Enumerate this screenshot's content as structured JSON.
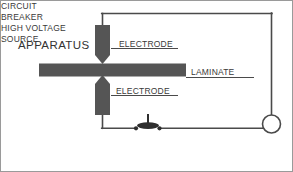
{
  "figure": {
    "background_color": "#ffffff",
    "border_color": "#9a9a9a",
    "line_color": "#4a4a4a",
    "part_color": "#555555",
    "text_color": "#3a3a3a"
  },
  "labels": {
    "apparatus": "APPARATUS",
    "electrode_top": "ELECTRODE",
    "electrode_bottom": "ELECTRODE",
    "laminate": "LAMINATE",
    "circuit_breaker_line1": "CIRCUIT",
    "circuit_breaker_line2": "BREAKER",
    "hv_source_line1": "HIGH VOLTAGE",
    "hv_source_line2": "SOURCE"
  },
  "diagram": {
    "type": "schematic",
    "components": [
      {
        "name": "electrode-top",
        "shape": "tapered-bar-pointing-down",
        "fill": "#555555",
        "x": 94,
        "y": 24,
        "width": 15,
        "height": 39
      },
      {
        "name": "electrode-bottom",
        "shape": "tapered-bar-pointing-up",
        "fill": "#555555",
        "x": 94,
        "y": 79,
        "width": 15,
        "height": 39
      },
      {
        "name": "laminate-bar",
        "shape": "horizontal-bar",
        "fill": "#555555",
        "x": 38,
        "y": 62,
        "width": 147,
        "height": 13
      },
      {
        "name": "circuit-breaker",
        "shape": "switch-with-lever",
        "fill": "#2e2e2e",
        "x": 132,
        "y": 114,
        "width": 30,
        "height": 17
      },
      {
        "name": "high-voltage-source",
        "shape": "circle",
        "fill": "#ffffff",
        "stroke": "#4a4a4a",
        "cx": 271,
        "cy": 123,
        "r": 9
      }
    ],
    "wires": [
      {
        "name": "wire-top-electrode-to-top-rail",
        "path": "M101,24 L101,12"
      },
      {
        "name": "wire-top-rail",
        "path": "M101,12 L271,12"
      },
      {
        "name": "wire-right-down-to-source",
        "path": "M271,12 L271,114"
      },
      {
        "name": "wire-bottom-electrode-down",
        "path": "M101,118 L101,127"
      },
      {
        "name": "wire-bottom-left-to-breaker",
        "path": "M101,127 L134,127"
      },
      {
        "name": "wire-breaker-to-source",
        "path": "M160,127 L262,127"
      }
    ],
    "leaders": [
      {
        "name": "leader-electrode-top",
        "path": "M109,47 L176,47",
        "label": "ELECTRODE"
      },
      {
        "name": "leader-electrode-bottom",
        "path": "M109,94 L176,94",
        "label": "ELECTRODE"
      },
      {
        "name": "leader-laminate",
        "path": "M185,76 L252,76",
        "label": "LAMINATE"
      }
    ]
  }
}
